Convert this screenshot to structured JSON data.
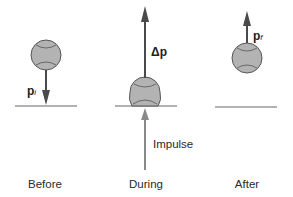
{
  "figure": {
    "panels": [
      {
        "id": "before",
        "caption": "Before",
        "vector_label": "p",
        "vector_subscript": "i",
        "arrow_direction": "down"
      },
      {
        "id": "during",
        "caption": "During",
        "vector_label": "Δp",
        "arrow_direction": "up",
        "force_label": "Impulse"
      },
      {
        "id": "after",
        "caption": "After",
        "vector_label": "p",
        "vector_subscript": "f",
        "arrow_direction": "up"
      }
    ],
    "colors": {
      "ball_fill": "#b3b3b3",
      "ball_stroke": "#555555",
      "arrow": "#4a4a4a",
      "impulse_arrow": "#8a8a8a",
      "ground": "#666666",
      "text": "#2a2a2a"
    }
  }
}
